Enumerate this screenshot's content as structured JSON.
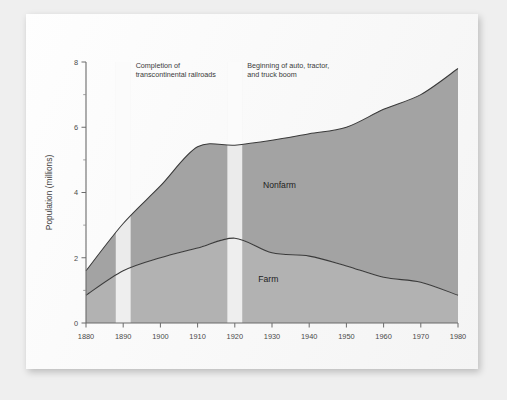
{
  "chart_data": {
    "type": "area",
    "title": "",
    "subtitle": "",
    "xlabel": "",
    "ylabel": "Population (millions)",
    "xlim": [
      1880,
      1980
    ],
    "ylim": [
      0,
      8
    ],
    "grid": false,
    "legend_position": "inline-labels",
    "stacked": true,
    "x": [
      1880,
      1890,
      1900,
      1910,
      1920,
      1930,
      1940,
      1950,
      1960,
      1970,
      1980
    ],
    "xticklabels": [
      "1880",
      "1890",
      "1900",
      "1910",
      "1920",
      "1930",
      "1940",
      "1950",
      "1960",
      "1970",
      "1980"
    ],
    "yticks": [
      0,
      2,
      4,
      6,
      8
    ],
    "yticklabels": [
      "0",
      "2",
      "4",
      "6",
      "8"
    ],
    "yticks_minor": [
      1,
      3,
      5,
      7
    ],
    "series": [
      {
        "name": "Farm",
        "color": "#b2b2b2",
        "values": [
          0.85,
          1.6,
          2.0,
          2.3,
          2.6,
          2.15,
          2.05,
          1.75,
          1.4,
          1.25,
          0.85
        ]
      },
      {
        "name": "Nonfarm",
        "color": "#a3a3a3",
        "values": [
          0.75,
          1.45,
          2.2,
          3.1,
          2.85,
          3.45,
          3.75,
          4.25,
          5.15,
          5.75,
          6.95
        ]
      }
    ],
    "totals": [
      1.6,
      3.05,
      4.2,
      5.4,
      5.45,
      5.6,
      5.8,
      6.0,
      6.55,
      7.0,
      7.8
    ],
    "annotations": [
      {
        "id": "railroads",
        "lines": [
          "Completion of",
          "transcontinental railroads"
        ],
        "band_start": 1888,
        "band_end": 1892,
        "band_color": "#ededed"
      },
      {
        "id": "auto-boom",
        "lines": [
          "Beginning of auto, tractor,",
          "and truck boom"
        ],
        "band_start": 1918,
        "band_end": 1922,
        "band_color": "#ededed"
      }
    ],
    "series_labels": [
      {
        "text": "Nonfarm",
        "x": 1932,
        "y": 4.15
      },
      {
        "text": "Farm",
        "x": 1929,
        "y": 1.25
      }
    ]
  },
  "colors": {
    "page_background": "#efefef",
    "sheet": "#fdfdfd",
    "axis": "#6b6b6b",
    "curve": "#3a3a3a",
    "farm_fill": "#b2b2b2",
    "nonfarm_fill": "#a3a3a3",
    "band": "#ededed",
    "text": "#3a3a3a"
  }
}
